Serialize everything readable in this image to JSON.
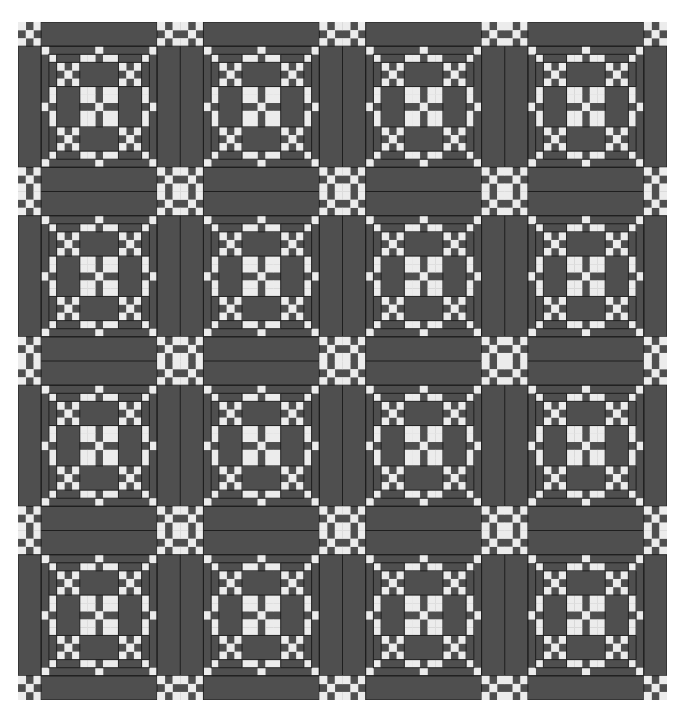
{
  "diagram": {
    "title": "",
    "type": "woven coverlet / quilt pattern draft",
    "colors": {
      "dark": "#4f4f4f",
      "light": "#ececec",
      "line": "#1e1e1e",
      "background": "#ffffff"
    },
    "grid": {
      "cols": 84,
      "rows": 84,
      "origin_px": [
        18,
        22
      ],
      "size_px": [
        649,
        678
      ]
    },
    "layout": {
      "block_size": 15,
      "sash_size": 6,
      "edge_size": 3,
      "blocks_across": 4,
      "blocks_down": 4
    },
    "block_pattern": [
      "W......W......W",
      ".W...WW.WW...W.",
      "..W.W.....W.W..",
      "...W.......W...",
      "..W.W.....W.W..",
      ".W...WW.WW...W.",
      ".W...WW.WW...W.",
      "W......W......W",
      ".W...WW.WW...W.",
      ".W...WW.WW...W.",
      "..W.W.....W.W..",
      "...W.......W...",
      "..W.W.....W.W..",
      ".W...WW.WW...W.",
      "W......W......W"
    ],
    "cornerstone_pattern": [
      "W.WW.W",
      ".W..W.",
      "W.WW.W",
      "W.WW.W",
      ".W..W.",
      "W.WW.W"
    ],
    "legend": []
  }
}
